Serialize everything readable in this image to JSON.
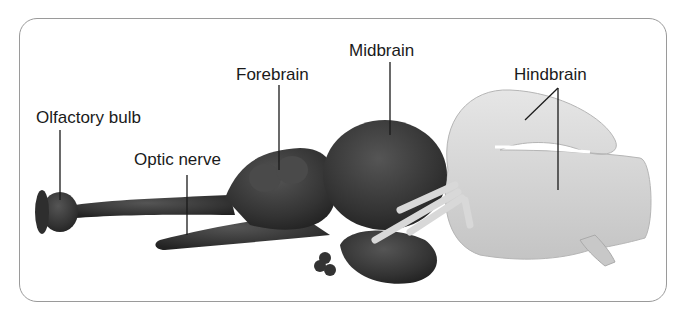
{
  "diagram": {
    "labels": {
      "olfactory_bulb": "Olfactory bulb",
      "optic_nerve": "Optic nerve",
      "forebrain": "Forebrain",
      "midbrain": "Midbrain",
      "hindbrain": "Hindbrain"
    },
    "colors": {
      "dark_regions": "#3a3a3a",
      "hindbrain": "#d4d4d4",
      "leader_lines": "#1a1a1a",
      "frame_border": "#9a9a9a"
    }
  }
}
